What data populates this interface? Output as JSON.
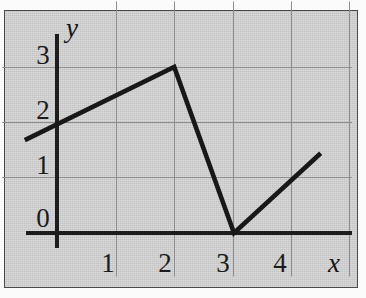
{
  "figure": {
    "background_color": "#cfcfcf",
    "border_color": "#4a4a4a",
    "line_color": "#181818",
    "grid_color": "#8d8d8d"
  },
  "axes": {
    "x_name": "x",
    "y_name": "y",
    "x_tick_labels": [
      "1",
      "2",
      "3",
      "4"
    ],
    "y_tick_labels": [
      "0",
      "1",
      "2",
      "3"
    ]
  },
  "chart_data": {
    "type": "line",
    "title": "",
    "subtitle": "",
    "xlabel": "x",
    "ylabel": "y",
    "xlim": [
      -0.6,
      5.1
    ],
    "ylim": [
      -0.2,
      3.6
    ],
    "xticks": [
      1,
      2,
      3,
      4
    ],
    "yticks": [
      0,
      1,
      2,
      3
    ],
    "xtick_labels": [
      "1",
      "2",
      "3",
      "4"
    ],
    "ytick_labels": [
      "0",
      "1",
      "2",
      "3"
    ],
    "grid": true,
    "grid_style": "solid light gray vertical and horizontal lines at integer ticks",
    "legend": null,
    "legend_position": "none",
    "annotations": [],
    "series": [
      {
        "name": "piecewise-linear",
        "x": [
          -0.55,
          2.0,
          3.02,
          4.5
        ],
        "y": [
          1.69,
          3.02,
          0.0,
          1.45
        ],
        "marker": "none",
        "linewidth": 4.6,
        "color": "#181818",
        "segments": [
          {
            "from": [
              -0.55,
              1.69
            ],
            "to": [
              2.0,
              3.02
            ],
            "description": "gentle rise crossing the y-axis near y = 1.9"
          },
          {
            "from": [
              2.0,
              3.02
            ],
            "to": [
              3.02,
              0.0
            ],
            "description": "steep fall to the x-axis at x = 3"
          },
          {
            "from": [
              3.02,
              0.0
            ],
            "to": [
              4.5,
              1.45
            ],
            "description": "rise from the x-axis to the right edge"
          }
        ]
      }
    ],
    "key_points": [
      {
        "label": "left endpoint",
        "x": -0.55,
        "y": 1.69
      },
      {
        "label": "y-intercept",
        "x": 0.0,
        "y": 1.9
      },
      {
        "label": "local maximum",
        "x": 2.0,
        "y": 3.02
      },
      {
        "label": "x-intercept / corner minimum",
        "x": 3.02,
        "y": 0.0
      },
      {
        "label": "right endpoint",
        "x": 4.5,
        "y": 1.45
      }
    ]
  }
}
